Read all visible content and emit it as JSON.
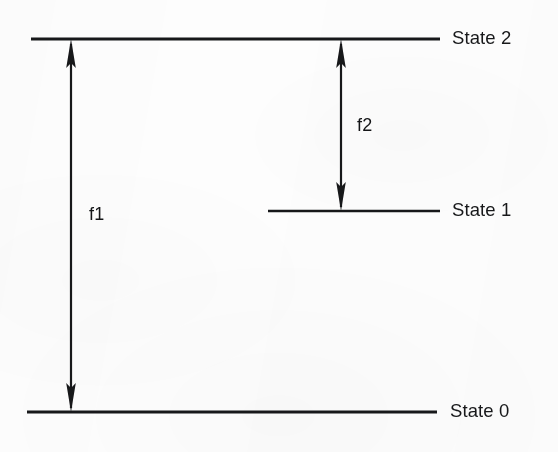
{
  "figure": {
    "kind": "energy-level-diagram",
    "width": 558,
    "height": 452,
    "background_color": "#fdfdfd",
    "ink_color": "#17181a"
  },
  "levels": [
    {
      "id": "state-2",
      "label": "State 2",
      "line": {
        "x1": 31,
        "x2": 440,
        "y": 39
      },
      "label_pos": {
        "x": 452,
        "y": 29
      }
    },
    {
      "id": "state-1",
      "label": "State 1",
      "line": {
        "x1": 268,
        "x2": 440,
        "y": 211
      },
      "label_pos": {
        "x": 452,
        "y": 201
      }
    },
    {
      "id": "state-0",
      "label": "State 0",
      "line": {
        "x1": 27,
        "x2": 437,
        "y": 412
      },
      "label_pos": {
        "x": 450,
        "y": 402
      }
    }
  ],
  "transitions": [
    {
      "id": "f1",
      "label": "f1",
      "from_level": "State 2",
      "to_level": "State 0",
      "arrow": {
        "x": 71,
        "y_top": 40,
        "y_bottom": 411,
        "double_headed": true
      },
      "label_pos": {
        "x": 89,
        "y": 205
      }
    },
    {
      "id": "f2",
      "label": "f2",
      "from_level": "State 2",
      "to_level": "State 1",
      "arrow": {
        "x": 341,
        "y_top": 40,
        "y_bottom": 210,
        "double_headed": true
      },
      "label_pos": {
        "x": 357,
        "y": 116
      }
    }
  ]
}
